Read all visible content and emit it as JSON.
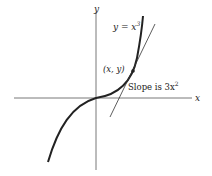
{
  "diagram": {
    "function_label": "y = x",
    "function_exponent": "3",
    "point_label": "(x, y)",
    "slope_label": "Slope is 3x",
    "slope_exponent": "2",
    "x_axis_label": "x",
    "y_axis_label": "y",
    "colors": {
      "curve": "#222222",
      "axes": "#555555",
      "tangent": "#333333",
      "background": "#ffffff"
    }
  }
}
